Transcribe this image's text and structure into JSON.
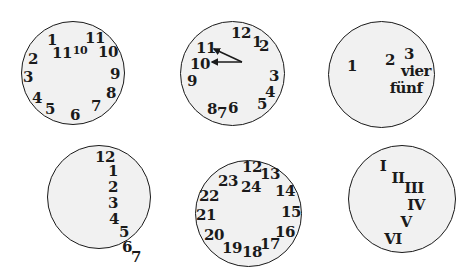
{
  "clocks": [
    {
      "id": "clock-1",
      "box": {
        "left": 21,
        "top": 21,
        "size": 104
      },
      "numbers": [
        {
          "t": "1",
          "x": 52,
          "y": 40,
          "s": 15
        },
        {
          "t": "11",
          "x": 62,
          "y": 53,
          "s": 15
        },
        {
          "t": "10",
          "x": 80,
          "y": 50,
          "s": 11
        },
        {
          "t": "11",
          "x": 95,
          "y": 38,
          "s": 15
        },
        {
          "t": "10",
          "x": 108,
          "y": 52,
          "s": 15
        },
        {
          "t": "2",
          "x": 33,
          "y": 59,
          "s": 15
        },
        {
          "t": "9",
          "x": 115,
          "y": 74,
          "s": 15
        },
        {
          "t": "3",
          "x": 28,
          "y": 77,
          "s": 15
        },
        {
          "t": "8",
          "x": 111,
          "y": 93,
          "s": 15
        },
        {
          "t": "4",
          "x": 37,
          "y": 98,
          "s": 15
        },
        {
          "t": "7",
          "x": 96,
          "y": 106,
          "s": 15
        },
        {
          "t": "5",
          "x": 50,
          "y": 109,
          "s": 15
        },
        {
          "t": "6",
          "x": 75,
          "y": 115,
          "s": 15
        }
      ]
    },
    {
      "id": "clock-2",
      "box": {
        "left": 180,
        "top": 21,
        "size": 105
      },
      "numbers": [
        {
          "t": "12",
          "x": 241,
          "y": 33,
          "s": 15
        },
        {
          "t": "1",
          "x": 257,
          "y": 42,
          "s": 15
        },
        {
          "t": "2",
          "x": 264,
          "y": 46,
          "s": 15
        },
        {
          "t": "11",
          "x": 206,
          "y": 48,
          "s": 15
        },
        {
          "t": "10",
          "x": 200,
          "y": 64,
          "s": 15
        },
        {
          "t": "9",
          "x": 192,
          "y": 81,
          "s": 15
        },
        {
          "t": "3",
          "x": 274,
          "y": 76,
          "s": 15
        },
        {
          "t": "4",
          "x": 270,
          "y": 92,
          "s": 15
        },
        {
          "t": "5",
          "x": 262,
          "y": 104,
          "s": 15
        },
        {
          "t": "8",
          "x": 212,
          "y": 109,
          "s": 15
        },
        {
          "t": "7",
          "x": 222,
          "y": 113,
          "s": 15
        },
        {
          "t": "6",
          "x": 233,
          "y": 108,
          "s": 15
        }
      ],
      "hands": [
        {
          "name": "hour-hand",
          "x1": 242,
          "y1": 62,
          "x2": 214,
          "y2": 49
        },
        {
          "name": "minute-hand",
          "x1": 242,
          "y1": 62,
          "x2": 212,
          "y2": 62
        }
      ]
    },
    {
      "id": "clock-3",
      "box": {
        "left": 328,
        "top": 21,
        "size": 107
      },
      "numbers": [
        {
          "t": "1",
          "x": 352,
          "y": 66,
          "s": 15
        },
        {
          "t": "2",
          "x": 390,
          "y": 60,
          "s": 15
        },
        {
          "t": "3",
          "x": 409,
          "y": 54,
          "s": 15
        },
        {
          "t": "vier",
          "x": 416,
          "y": 71,
          "s": 15
        },
        {
          "t": "fünf",
          "x": 406,
          "y": 88,
          "s": 15
        }
      ]
    },
    {
      "id": "clock-4",
      "box": {
        "left": 47,
        "top": 145,
        "size": 104
      },
      "numbers": [
        {
          "t": "12",
          "x": 105,
          "y": 157,
          "s": 15
        },
        {
          "t": "1",
          "x": 113,
          "y": 171,
          "s": 15
        },
        {
          "t": "2",
          "x": 113,
          "y": 187,
          "s": 15
        },
        {
          "t": "3",
          "x": 113,
          "y": 203,
          "s": 15
        },
        {
          "t": "4",
          "x": 114,
          "y": 219,
          "s": 15
        },
        {
          "t": "5",
          "x": 124,
          "y": 232,
          "s": 15
        },
        {
          "t": "6",
          "x": 127,
          "y": 247,
          "s": 15
        },
        {
          "t": "7",
          "x": 136,
          "y": 257,
          "s": 15
        }
      ]
    },
    {
      "id": "clock-5",
      "box": {
        "left": 195,
        "top": 160,
        "size": 107
      },
      "numbers": [
        {
          "t": "12",
          "x": 252,
          "y": 167,
          "s": 15
        },
        {
          "t": "13",
          "x": 270,
          "y": 174,
          "s": 15
        },
        {
          "t": "23",
          "x": 228,
          "y": 181,
          "s": 15
        },
        {
          "t": "24",
          "x": 251,
          "y": 187,
          "s": 15
        },
        {
          "t": "14",
          "x": 285,
          "y": 191,
          "s": 15
        },
        {
          "t": "22",
          "x": 209,
          "y": 196,
          "s": 15
        },
        {
          "t": "15",
          "x": 291,
          "y": 212,
          "s": 15
        },
        {
          "t": "21",
          "x": 206,
          "y": 215,
          "s": 15
        },
        {
          "t": "16",
          "x": 285,
          "y": 232,
          "s": 15
        },
        {
          "t": "20",
          "x": 214,
          "y": 235,
          "s": 15
        },
        {
          "t": "17",
          "x": 270,
          "y": 244,
          "s": 15
        },
        {
          "t": "19",
          "x": 232,
          "y": 248,
          "s": 15
        },
        {
          "t": "18",
          "x": 252,
          "y": 252,
          "s": 15
        }
      ]
    },
    {
      "id": "clock-6",
      "box": {
        "left": 348,
        "top": 145,
        "size": 108
      },
      "numbers": [
        {
          "t": "I",
          "x": 383,
          "y": 166,
          "s": 15
        },
        {
          "t": "II",
          "x": 398,
          "y": 178,
          "s": 15
        },
        {
          "t": "III",
          "x": 414,
          "y": 188,
          "s": 15
        },
        {
          "t": "IV",
          "x": 416,
          "y": 205,
          "s": 15
        },
        {
          "t": "V",
          "x": 406,
          "y": 222,
          "s": 15
        },
        {
          "t": "VI",
          "x": 393,
          "y": 239,
          "s": 15
        }
      ]
    }
  ]
}
